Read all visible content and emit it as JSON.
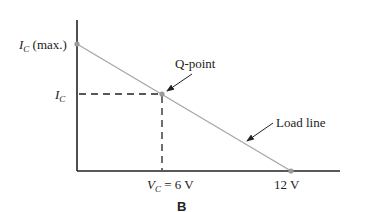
{
  "figure": {
    "panel_label": "B",
    "labels": {
      "ic_max": "I",
      "ic_max_sub": "C",
      "ic_max_suffix": " (max.)",
      "ic": "I",
      "ic_sub": "C",
      "q_point": "Q-point",
      "load_line": "Load line",
      "vc": "V",
      "vc_sub": "C",
      "vc_value": " = 6 V",
      "v_max": "12 V"
    },
    "colors": {
      "axis": "#222222",
      "load_line": "#a8a8a8",
      "point": "#9a9a9a",
      "dashed": "#222222"
    },
    "points": {
      "ic_max": [
        77,
        44
      ],
      "q_point": [
        162,
        94
      ],
      "v_max": [
        291,
        171
      ]
    }
  }
}
